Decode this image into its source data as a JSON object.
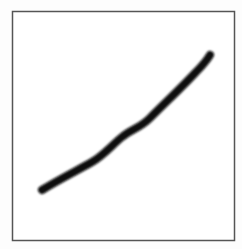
{
  "drawing": {
    "background": "#ffffff",
    "frame": {
      "x": 12.5,
      "y": 11.5,
      "width": 222,
      "height": 229,
      "stroke": "#555555",
      "stroke_width": 1.5
    },
    "stroke": {
      "color": "#0a0a0a",
      "width": 8,
      "blur": 0.8,
      "path": "M 42 190 C 58 180, 78 170, 92 162 C 104 155, 112 145, 122 137 C 132 129, 140 128, 150 118 C 165 103, 185 84, 196 72 C 203 65, 207 60, 210 55"
    }
  }
}
